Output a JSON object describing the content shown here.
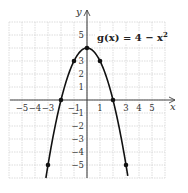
{
  "chart_data": {
    "type": "line",
    "title": "",
    "function_label": "g(x) = 4 − x²",
    "function_label_parts": {
      "name": "g(x) = 4 − x",
      "exponent": "2"
    },
    "xlabel": "x",
    "ylabel": "y",
    "xlim": [
      -6,
      6
    ],
    "ylim": [
      -6,
      6
    ],
    "grid": true,
    "x_tick_labels": [
      "−5",
      "−4",
      "−3",
      "−1",
      "1",
      "3",
      "4",
      "5"
    ],
    "x_tick_values": [
      -5,
      -4,
      -3,
      -1,
      1,
      3,
      4,
      5
    ],
    "y_tick_labels": [
      "5",
      "3",
      "2",
      "1",
      "−1",
      "−2",
      "−3",
      "−4",
      "−5"
    ],
    "y_tick_values": [
      5,
      3,
      2,
      1,
      -1,
      -2,
      -3,
      -4,
      -5
    ],
    "series": [
      {
        "name": "g(x) = 4 − x²",
        "marked_points": [
          {
            "x": -3,
            "y": -5
          },
          {
            "x": -2,
            "y": 0
          },
          {
            "x": -1,
            "y": 3
          },
          {
            "x": 0,
            "y": 4
          },
          {
            "x": 1,
            "y": 3
          },
          {
            "x": 2,
            "y": 0
          },
          {
            "x": 3,
            "y": -5
          }
        ]
      }
    ]
  }
}
